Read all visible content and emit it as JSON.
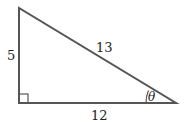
{
  "diagram": {
    "type": "right-triangle",
    "labels": {
      "vertical_leg": "5",
      "horizontal_leg": "12",
      "hypotenuse": "13",
      "angle": "θ"
    },
    "colors": {
      "stroke": "#555555",
      "text": "#222222",
      "background": "#ffffff"
    }
  }
}
